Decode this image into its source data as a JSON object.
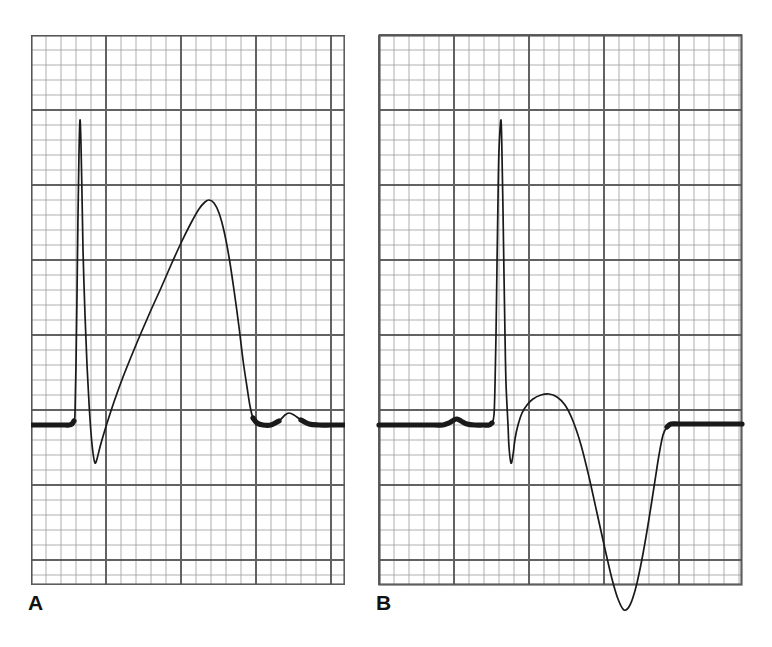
{
  "figure": {
    "kind": "ecg-strip-pair",
    "background_color": "#ffffff",
    "trace_color": "#1a1a1a",
    "grid_minor_color": "#8b8b8b",
    "grid_major_color": "#555555",
    "panels": [
      {
        "id": "A",
        "label": "A",
        "origin_x": 31,
        "origin_y": 35,
        "width": 314,
        "height": 550,
        "small_box_px": 15,
        "cols": 21,
        "rows": 37,
        "major_every": 5,
        "baseline_y": 390,
        "description": "Upright tall R wave with upright T wave"
      },
      {
        "id": "B",
        "label": "B",
        "origin_x": 379,
        "origin_y": 35,
        "width": 363,
        "height": 550,
        "small_box_px": 15,
        "cols": 24,
        "rows": 37,
        "major_every": 5,
        "baseline_y": 390,
        "description": "Tall R wave with deeply inverted T wave"
      }
    ]
  },
  "chart_data": {
    "type": "line",
    "title": "",
    "subtitle": "",
    "xlabel": "",
    "ylabel": "",
    "grid": true,
    "legend_position": "none",
    "axis_note": "ECG graph paper: small box = 1 mm, bold box = 5 mm",
    "series": [
      {
        "name": "A",
        "panel": "A",
        "baseline_y": 390,
        "annotations": [
          {
            "name": "isoelectric-baseline",
            "x_start": 0,
            "x_end": 41,
            "y": 390
          },
          {
            "name": "R-wave-peak",
            "x": 49,
            "y": 85
          },
          {
            "name": "S-wave-nadir",
            "x": 64,
            "y": 428
          },
          {
            "name": "T-wave-peak",
            "x": 178,
            "y": 165
          },
          {
            "name": "T-wave-end",
            "x": 222,
            "y": 383
          },
          {
            "name": "U-wave-bump",
            "x": 258,
            "y": 378
          }
        ],
        "points": [
          [
            0,
            390
          ],
          [
            12,
            390
          ],
          [
            24,
            390
          ],
          [
            34,
            390
          ],
          [
            38,
            390
          ],
          [
            41,
            389
          ],
          [
            43,
            386
          ],
          [
            44,
            378
          ],
          [
            45,
            330
          ],
          [
            46,
            260
          ],
          [
            47,
            180
          ],
          [
            48,
            118
          ],
          [
            49,
            85
          ],
          [
            50,
            110
          ],
          [
            51,
            160
          ],
          [
            52,
            215
          ],
          [
            54,
            280
          ],
          [
            56,
            330
          ],
          [
            58,
            368
          ],
          [
            60,
            398
          ],
          [
            62,
            418
          ],
          [
            64,
            428
          ],
          [
            66,
            424
          ],
          [
            69,
            412
          ],
          [
            73,
            398
          ],
          [
            78,
            382
          ],
          [
            84,
            364
          ],
          [
            92,
            342
          ],
          [
            100,
            322
          ],
          [
            110,
            298
          ],
          [
            120,
            275
          ],
          [
            130,
            253
          ],
          [
            140,
            230
          ],
          [
            150,
            208
          ],
          [
            160,
            188
          ],
          [
            168,
            174
          ],
          [
            174,
            167
          ],
          [
            178,
            165
          ],
          [
            183,
            168
          ],
          [
            188,
            178
          ],
          [
            193,
            196
          ],
          [
            198,
            222
          ],
          [
            203,
            255
          ],
          [
            208,
            292
          ],
          [
            212,
            325
          ],
          [
            216,
            352
          ],
          [
            219,
            371
          ],
          [
            222,
            383
          ],
          [
            226,
            388
          ],
          [
            232,
            390
          ],
          [
            240,
            390
          ],
          [
            248,
            386
          ],
          [
            254,
            380
          ],
          [
            258,
            378
          ],
          [
            263,
            380
          ],
          [
            270,
            385
          ],
          [
            278,
            389
          ],
          [
            288,
            390
          ],
          [
            300,
            390
          ],
          [
            314,
            390
          ]
        ]
      },
      {
        "name": "B",
        "panel": "B",
        "baseline_y": 390,
        "annotations": [
          {
            "name": "isoelectric-baseline",
            "x_start": 0,
            "x_end": 100,
            "y": 390
          },
          {
            "name": "P-wave-bump",
            "x": 78,
            "y": 384
          },
          {
            "name": "R-wave-peak",
            "x": 122,
            "y": 85
          },
          {
            "name": "S-wave-nadir",
            "x": 132,
            "y": 428
          },
          {
            "name": "inverted-T-nadir",
            "x": 245,
            "y": 575
          },
          {
            "name": "baseline-return",
            "x": 290,
            "y": 390
          }
        ],
        "points": [
          [
            0,
            390
          ],
          [
            20,
            390
          ],
          [
            40,
            390
          ],
          [
            55,
            390
          ],
          [
            64,
            390
          ],
          [
            70,
            388
          ],
          [
            75,
            385
          ],
          [
            78,
            384
          ],
          [
            82,
            386
          ],
          [
            88,
            389
          ],
          [
            96,
            390
          ],
          [
            104,
            390
          ],
          [
            110,
            390
          ],
          [
            113,
            388
          ],
          [
            115,
            380
          ],
          [
            116,
            350
          ],
          [
            117,
            300
          ],
          [
            118,
            230
          ],
          [
            119,
            165
          ],
          [
            120,
            115
          ],
          [
            122,
            85
          ],
          [
            123,
            120
          ],
          [
            124,
            175
          ],
          [
            125,
            240
          ],
          [
            126,
            300
          ],
          [
            127,
            348
          ],
          [
            129,
            390
          ],
          [
            130,
            412
          ],
          [
            132,
            428
          ],
          [
            134,
            420
          ],
          [
            136,
            404
          ],
          [
            139,
            390
          ],
          [
            143,
            378
          ],
          [
            148,
            370
          ],
          [
            154,
            364
          ],
          [
            162,
            360
          ],
          [
            170,
            359
          ],
          [
            178,
            362
          ],
          [
            186,
            370
          ],
          [
            194,
            386
          ],
          [
            202,
            410
          ],
          [
            210,
            442
          ],
          [
            218,
            478
          ],
          [
            226,
            514
          ],
          [
            233,
            544
          ],
          [
            239,
            564
          ],
          [
            245,
            575
          ],
          [
            251,
            570
          ],
          [
            257,
            552
          ],
          [
            263,
            524
          ],
          [
            269,
            490
          ],
          [
            275,
            452
          ],
          [
            280,
            420
          ],
          [
            284,
            400
          ],
          [
            288,
            392
          ],
          [
            292,
            389
          ],
          [
            300,
            389
          ],
          [
            312,
            389
          ],
          [
            330,
            389
          ],
          [
            348,
            389
          ],
          [
            363,
            389
          ]
        ]
      }
    ]
  }
}
